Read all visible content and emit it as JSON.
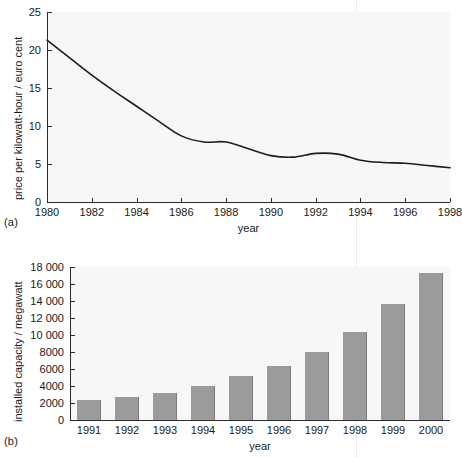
{
  "figure": {
    "panel_a_tag": "(a)",
    "panel_b_tag": "(b)",
    "background_color": "#ffffff",
    "plot_background_color": "#f7f7f7",
    "line_color": "#1c1c1c",
    "bar_color": "#9b9b9b",
    "bar_edge_color": "#7b7b7b",
    "axis_color": "#2b2b2b"
  },
  "chart_data": [
    {
      "type": "line",
      "panel": "(a)",
      "title": "",
      "xlabel": "year",
      "ylabel": "price per kilowatt-hour / euro cent",
      "xlim": [
        1980,
        1998
      ],
      "ylim": [
        0,
        25
      ],
      "xticks": [
        1980,
        1982,
        1984,
        1986,
        1988,
        1990,
        1992,
        1994,
        1996,
        1998
      ],
      "xticklabels": [
        "1980",
        "1982",
        "1984",
        "1986",
        "1988",
        "1990",
        "1992",
        "1994",
        "1996",
        "1998"
      ],
      "yticks": [
        0,
        5,
        10,
        15,
        20,
        25
      ],
      "yticklabels": [
        "0",
        "5",
        "10",
        "15",
        "20",
        "25"
      ],
      "grid": false,
      "legend": "none",
      "x": [
        1980,
        1981,
        1982,
        1983,
        1984,
        1985,
        1986,
        1987,
        1988,
        1989,
        1990,
        1991,
        1992,
        1993,
        1994,
        1995,
        1996,
        1997,
        1998
      ],
      "values": [
        21.3,
        19.0,
        16.7,
        14.6,
        12.6,
        10.6,
        8.7,
        7.9,
        7.9,
        7.0,
        6.1,
        5.9,
        6.4,
        6.3,
        5.5,
        5.2,
        5.1,
        4.8,
        4.5
      ]
    },
    {
      "type": "bar",
      "panel": "(b)",
      "title": "",
      "xlabel": "year",
      "ylabel": "installed capacity / megawatt",
      "ylim": [
        0,
        18000
      ],
      "yticks": [
        0,
        2000,
        4000,
        6000,
        8000,
        10000,
        12000,
        14000,
        16000,
        18000
      ],
      "yticklabels": [
        "0",
        "2000",
        "4000",
        "6000",
        "8000",
        "10 000",
        "12 000",
        "14 000",
        "16 000",
        "18 000"
      ],
      "grid": false,
      "legend": "none",
      "categories": [
        "1991",
        "1992",
        "1993",
        "1994",
        "1995",
        "1996",
        "1997",
        "1998",
        "1999",
        "2000"
      ],
      "values": [
        2400,
        2700,
        3200,
        4000,
        5200,
        6300,
        7950,
        10400,
        13650,
        17300
      ]
    }
  ]
}
